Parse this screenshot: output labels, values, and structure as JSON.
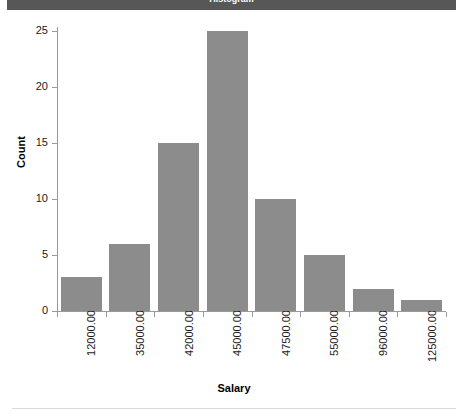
{
  "header": {
    "title": "Histogram"
  },
  "chart_data": {
    "type": "bar",
    "title": "Histogram",
    "xlabel": "Salary",
    "ylabel": "Count",
    "categories": [
      "12000.00",
      "35000.00",
      "42000.00",
      "45000.00",
      "47500.00",
      "55000.00",
      "96000.00",
      "125000.00"
    ],
    "values": [
      3,
      6,
      15,
      25,
      10,
      5,
      2,
      1
    ],
    "ylim": [
      0,
      25
    ],
    "yticks": [
      "0",
      "5",
      "10",
      "15",
      "20",
      "25"
    ],
    "ytick_values": [
      0,
      5,
      10,
      15,
      20,
      25
    ],
    "grid": false,
    "legend": false,
    "bar_color": "#8c8c8c",
    "axis_color": "#9a9a9a",
    "background": "#ffffff",
    "header_color": "#575757"
  }
}
